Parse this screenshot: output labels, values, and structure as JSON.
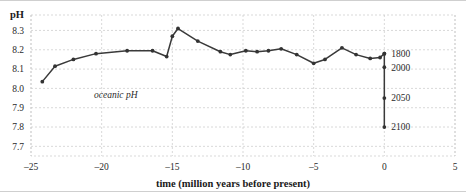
{
  "chart_data": {
    "type": "line",
    "title": "",
    "xlabel": "time (million years before present)",
    "ylabel": "pH",
    "xlim": [
      -25,
      5
    ],
    "ylim": [
      7.65,
      8.38
    ],
    "grid": true,
    "legend_position": "none",
    "x_ticks": [
      -25,
      -20,
      -15,
      -10,
      -5,
      0,
      5
    ],
    "x_tick_labels": [
      "–25",
      "–20",
      "–15",
      "–10",
      "–5",
      "0",
      "5"
    ],
    "y_ticks": [
      7.7,
      7.8,
      7.9,
      8.0,
      8.1,
      8.2,
      8.3
    ],
    "y_tick_labels": [
      "7.7",
      "7.8",
      "7.9",
      "8.0",
      "8.1",
      "8.2",
      "8.3"
    ],
    "annotations": [
      {
        "text": "oceanic pH",
        "x": -19.0,
        "y": 7.95,
        "style": "italic"
      }
    ],
    "series": [
      {
        "name": "oceanic pH",
        "marker": "circle",
        "color": "#333333",
        "x": [
          -24.2,
          -23.3,
          -22.0,
          -20.4,
          -18.2,
          -16.4,
          -15.4,
          -15.0,
          -14.6,
          -13.2,
          -11.6,
          -10.9,
          -9.8,
          -9.0,
          -8.2,
          -7.3,
          -6.2,
          -5.0,
          -4.2,
          -3.0,
          -2.0,
          -1.0,
          -0.3,
          0.0
        ],
        "values": [
          8.035,
          8.115,
          8.15,
          8.18,
          8.195,
          8.195,
          8.165,
          8.27,
          8.31,
          8.245,
          8.19,
          8.175,
          8.195,
          8.19,
          8.195,
          8.205,
          8.175,
          8.13,
          8.15,
          8.21,
          8.175,
          8.155,
          8.16,
          8.18
        ]
      },
      {
        "name": "projection",
        "marker": "circle",
        "color": "#333333",
        "x": [
          0.0,
          0.0,
          0.0,
          0.0
        ],
        "values": [
          8.18,
          8.11,
          7.95,
          7.8
        ],
        "point_labels": [
          "1800",
          "2000",
          "2050",
          "2100"
        ]
      }
    ]
  }
}
